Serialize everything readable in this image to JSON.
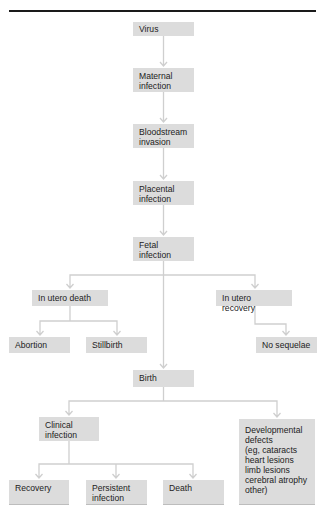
{
  "diagram": {
    "type": "flowchart",
    "title": "",
    "nodes": {
      "virus": "Virus",
      "maternal_infection": "Maternal\ninfection",
      "bloodstream_invasion": "Bloodstream\ninvasion",
      "placental_infection": "Placental\ninfection",
      "fetal_infection": "Fetal\ninfection",
      "in_utero_death": "In utero death",
      "in_utero_recovery": "In utero recovery",
      "abortion": "Abortion",
      "stillbirth": "Stillbirth",
      "no_sequelae": "No sequelae",
      "birth": "Birth",
      "clinical_infection": "Clinical\ninfection",
      "developmental_defects": "Developmental\ndefects\n(eg, cataracts\nheart lesions\nlimb lesions\ncerebral atrophy\nother)",
      "recovery": "Recovery",
      "persistent_infection": "Persistent\ninfection",
      "death": "Death"
    },
    "edges": [
      [
        "virus",
        "maternal_infection"
      ],
      [
        "maternal_infection",
        "bloodstream_invasion"
      ],
      [
        "bloodstream_invasion",
        "placental_infection"
      ],
      [
        "placental_infection",
        "fetal_infection"
      ],
      [
        "fetal_infection",
        "in_utero_death"
      ],
      [
        "fetal_infection",
        "birth"
      ],
      [
        "fetal_infection",
        "in_utero_recovery"
      ],
      [
        "in_utero_death",
        "abortion"
      ],
      [
        "in_utero_death",
        "stillbirth"
      ],
      [
        "in_utero_recovery",
        "no_sequelae"
      ],
      [
        "birth",
        "clinical_infection"
      ],
      [
        "birth",
        "developmental_defects"
      ],
      [
        "clinical_infection",
        "recovery"
      ],
      [
        "clinical_infection",
        "persistent_infection"
      ],
      [
        "clinical_infection",
        "death"
      ]
    ],
    "colors": {
      "box_fill": "#dcdcdc",
      "connector": "#cfcfcf",
      "rule": "#1a1a1a",
      "text": "#222222"
    }
  }
}
